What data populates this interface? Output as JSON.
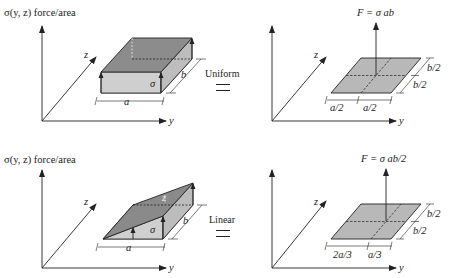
{
  "panels": [
    {
      "id": "uniform",
      "source": {
        "title": "σ(y, z) force/area",
        "axes": {
          "vertical": "σ",
          "y": "y",
          "z": "z"
        },
        "dims": {
          "width": "a",
          "depth": "b"
        },
        "stress_label": "σ",
        "distribution": "uniform box"
      },
      "relation": {
        "label": "Uniform",
        "symbol": "="
      },
      "equivalent": {
        "force_label": "F = σ ab",
        "axes": {
          "y": "y",
          "z": "z"
        },
        "dims": {
          "y_left": "a/2",
          "y_right": "a/2",
          "z_back": "b/2",
          "z_front": "b/2"
        }
      }
    },
    {
      "id": "linear",
      "source": {
        "title": "σ(y, z) force/area",
        "axes": {
          "vertical": "σ",
          "y": "y",
          "z": "z"
        },
        "dims": {
          "width": "a",
          "depth": "b"
        },
        "stress_label": "σ",
        "top_label": "z",
        "distribution": "linear wedge"
      },
      "relation": {
        "label": "Linear",
        "symbol": "="
      },
      "equivalent": {
        "force_label": "F = σ ab/2",
        "axes": {
          "y": "y",
          "z": "z"
        },
        "dims": {
          "y_left": "2a/3",
          "y_right": "a/3",
          "z_back": "b/2",
          "z_front": "b/2"
        }
      }
    }
  ],
  "colors": {
    "ink": "#222222",
    "face_dark": "#8a8a8a",
    "face_light": "#c4c4c4",
    "plate": "#b8b8b8"
  }
}
